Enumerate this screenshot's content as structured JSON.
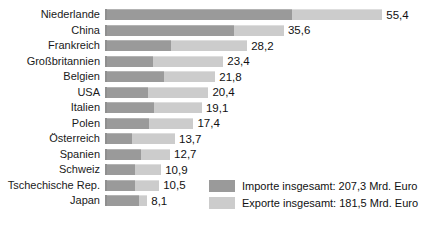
{
  "chart_data": {
    "type": "bar",
    "orientation": "horizontal",
    "stacked": true,
    "title": "",
    "xlabel": "",
    "ylabel": "",
    "unit": "Mrd. Euro",
    "xlim": [
      0,
      60
    ],
    "grid": false,
    "legend_position": "bottom-right",
    "categories": [
      "Niederlande",
      "China",
      "Frankreich",
      "Großbritannien",
      "Belgien",
      "USA",
      "Italien",
      "Polen",
      "Österreich",
      "Spanien",
      "Schweiz",
      "Tschechische Rep.",
      "Japan"
    ],
    "series": [
      {
        "name": "Importe",
        "color": "#9a9a9a",
        "values": [
          37.3,
          25.5,
          12.9,
          9.3,
          11.5,
          8.2,
          9.4,
          8.4,
          5.1,
          6.9,
          5.6,
          5.6,
          6.4
        ]
      },
      {
        "name": "Exporte",
        "color": "#cccccc",
        "values": [
          18.1,
          10.1,
          15.3,
          14.1,
          10.3,
          12.2,
          9.7,
          9.0,
          8.6,
          5.8,
          5.3,
          4.9,
          1.7
        ]
      }
    ],
    "totals": [
      55.4,
      35.6,
      28.2,
      23.4,
      21.8,
      20.4,
      19.1,
      17.4,
      13.7,
      12.7,
      10.9,
      10.5,
      8.1
    ],
    "total_labels": [
      "55,4",
      "35,6",
      "28,2",
      "23,4",
      "21,8",
      "20,4",
      "19,1",
      "17,4",
      "13,7",
      "12,7",
      "10,9",
      "10,5",
      "8,1"
    ]
  },
  "legend": {
    "items": [
      {
        "label": "Importe insgesamt: 207,3 Mrd. Euro",
        "color": "#9a9a9a"
      },
      {
        "label": "Exporte insgesamt: 181,5 Mrd. Euro",
        "color": "#cccccc"
      }
    ]
  },
  "colors": {
    "import_bar": "#9a9a9a",
    "export_bar": "#cccccc",
    "axis_line": "#8f8f8f",
    "text": "#111111",
    "background": "#ffffff"
  }
}
